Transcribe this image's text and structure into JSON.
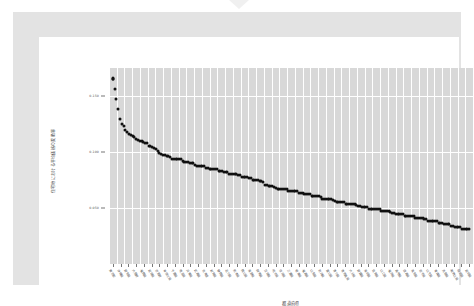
{
  "figure": {
    "background_color": "#ffffff",
    "frame_color": "#e3e3e3",
    "card_color": "#ffffff",
    "notch_icon": "triangle-down-icon"
  },
  "chart_data": {
    "type": "scatter",
    "title": "",
    "subtitle": "",
    "xlabel": "都道府県",
    "ylabel": "住宅地における平均価格の変動率",
    "plot_background": "#d8d8d8",
    "gridline_color": "#ffffff",
    "marker_color": "#111111",
    "grid": true,
    "legend": null,
    "ylim": [
      0.0,
      0.175
    ],
    "ytick_values": [
      0.15,
      0.1,
      0.05
    ],
    "ytick_labels": [
      "0.150",
      "0.100",
      "0.050"
    ],
    "categories": [
      "東京都",
      "沖縄県",
      "愛知県",
      "大阪府",
      "福岡県",
      "宮城県",
      "京都府",
      "神奈川県",
      "千葉県",
      "埼玉県",
      "兵庫県",
      "広島県",
      "北海道",
      "滋賀県",
      "静岡県",
      "石川県",
      "熊本県",
      "岡山県",
      "長野県",
      "群馬県",
      "茨城県",
      "栃木県",
      "奈良県",
      "三重県",
      "岐阜県",
      "福島県",
      "山梨県",
      "新潟県",
      "富山県",
      "香川県",
      "鹿児島県",
      "大分県",
      "愛媛県",
      "長崎県",
      "佐賀県",
      "山口県",
      "福井県",
      "島根県",
      "徳島県",
      "高知県",
      "岩手県",
      "山形県",
      "青森県",
      "鳥取県",
      "和歌山県",
      "秋田県",
      "宮崎県"
    ],
    "values": [
      0.166,
      0.1265,
      0.1165,
      0.112,
      0.1085,
      0.105,
      0.0995,
      0.096,
      0.094,
      0.0925,
      0.09,
      0.088,
      0.0862,
      0.0846,
      0.083,
      0.0812,
      0.0796,
      0.078,
      0.076,
      0.0742,
      0.07,
      0.0682,
      0.0668,
      0.0654,
      0.064,
      0.0625,
      0.061,
      0.0592,
      0.0575,
      0.056,
      0.0545,
      0.053,
      0.0516,
      0.0502,
      0.0488,
      0.0474,
      0.046,
      0.0446,
      0.0432,
      0.0418,
      0.0404,
      0.039,
      0.0376,
      0.0356,
      0.0338,
      0.0322,
      0.0308
    ],
    "n_points": 200,
    "point_count_note": "dense ranked series",
    "series_dense": {
      "description": "monotonically decreasing ranked values",
      "start": 0.166,
      "tail": 0.0295
    }
  }
}
